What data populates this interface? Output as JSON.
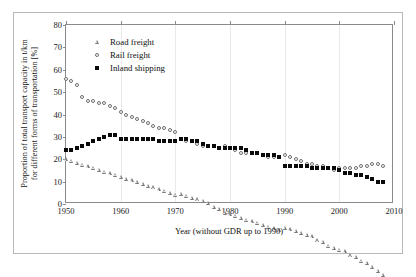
{
  "figure": {
    "xlabel": "Year (without GDR up to 1990)",
    "ylabel_line1": "Proportion of total transport capacity in t/km",
    "ylabel_line2": "for different forms of transportation [%]"
  },
  "legend": {
    "entries": [
      {
        "label": "Road freight",
        "marker": "open-triangle-icon",
        "color": "#7a7a7a"
      },
      {
        "label": "Rail freight",
        "marker": "open-circle-icon",
        "color": "#6e6e6e"
      },
      {
        "label": "Inland shipping",
        "marker": "filled-square-icon",
        "color": "#0a0a0a"
      }
    ]
  },
  "axes": {
    "y_ticks": [
      "0",
      "10",
      "20",
      "30",
      "40",
      "50",
      "60",
      "70",
      "80"
    ],
    "x_ticks": [
      "1950",
      "1960",
      "1970",
      "1980",
      "1990",
      "2000",
      "2010"
    ]
  },
  "chart_data": {
    "type": "scatter",
    "title": "",
    "xlabel": "Year (without GDR up to 1990)",
    "ylabel": "Proportion of total transport capacity in t/km for different forms of transportation [%]",
    "xlim": [
      1950,
      2010
    ],
    "ylim": [
      0,
      80
    ],
    "ytick_step": 10,
    "xtick_step": 10,
    "grid": false,
    "legend_position": "upper-left-inside",
    "note": "Series break at 1990 where GDR territory is included",
    "x": [
      1950,
      1951,
      1952,
      1953,
      1954,
      1955,
      1956,
      1957,
      1958,
      1959,
      1960,
      1961,
      1962,
      1963,
      1964,
      1965,
      1966,
      1967,
      1968,
      1969,
      1970,
      1971,
      1972,
      1973,
      1974,
      1975,
      1976,
      1977,
      1978,
      1979,
      1980,
      1981,
      1982,
      1983,
      1984,
      1985,
      1986,
      1987,
      1988,
      1989,
      1990,
      1991,
      1992,
      1993,
      1994,
      1995,
      1996,
      1997,
      1998,
      1999,
      2000,
      2001,
      2002,
      2003,
      2004,
      2005,
      2006,
      2007,
      2008
    ],
    "series": [
      {
        "name": "Rail freight",
        "marker": "open-circle",
        "values": [
          56,
          55,
          53,
          48,
          46,
          46,
          45,
          45,
          44,
          43,
          41,
          40,
          39,
          38,
          37,
          36,
          35,
          34,
          34,
          33,
          32,
          29,
          28,
          28,
          27,
          26,
          26,
          26,
          25,
          26,
          25,
          24,
          23,
          23,
          23,
          23,
          22,
          21,
          21,
          21,
          22,
          21,
          20,
          19,
          18,
          18,
          17,
          17,
          16,
          15,
          16,
          16,
          16,
          16,
          17,
          17,
          18,
          18,
          17
        ]
      },
      {
        "name": "Road freight",
        "marker": "open-triangle",
        "values": [
          20,
          21,
          22,
          23,
          24,
          25,
          26,
          27,
          28,
          29,
          30,
          31,
          32,
          33,
          34,
          35,
          36,
          37,
          38,
          39,
          40,
          42,
          43,
          44,
          45,
          46,
          47,
          47,
          48,
          48,
          49,
          50,
          51,
          52,
          53,
          54,
          55,
          56,
          57,
          58,
          61,
          62,
          63,
          64,
          65,
          66,
          66,
          67,
          67,
          68,
          69,
          70,
          70,
          71,
          71,
          72,
          72,
          72,
          72
        ]
      },
      {
        "name": "Inland shipping",
        "marker": "filled-square",
        "values": [
          24,
          24,
          25,
          26,
          27,
          28,
          29,
          30,
          31,
          31,
          29,
          29,
          29,
          29,
          29,
          29,
          29,
          28,
          28,
          28,
          28,
          29,
          29,
          28,
          28,
          27,
          26,
          26,
          25,
          25,
          25,
          25,
          25,
          24,
          23,
          23,
          22,
          22,
          22,
          21,
          17,
          17,
          17,
          17,
          17,
          16,
          16,
          16,
          16,
          16,
          15,
          14,
          14,
          13,
          13,
          12,
          11,
          10,
          10
        ]
      }
    ]
  }
}
